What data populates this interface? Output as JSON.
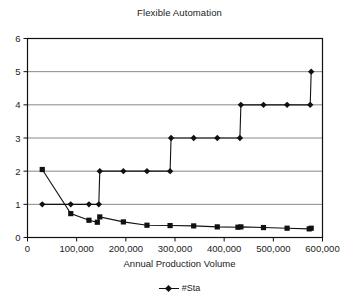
{
  "chart_data": {
    "type": "line",
    "title": "Flexible Automation",
    "xlabel": "Annual Production Volume",
    "ylabel": "",
    "xlim": [
      0,
      600000
    ],
    "ylim": [
      0,
      6
    ],
    "xticks": [
      0,
      100000,
      200000,
      300000,
      400000,
      500000,
      600000
    ],
    "xtick_labels": [
      "0",
      "100,000",
      "200,000",
      "300,000",
      "400,000",
      "500,000",
      "600,000"
    ],
    "yticks": [
      0,
      1,
      2,
      3,
      4,
      5,
      6
    ],
    "ytick_labels": [
      "0",
      "1",
      "2",
      "3",
      "4",
      "5",
      "6"
    ],
    "grid": "horizontal",
    "legend_position": "bottom",
    "series": [
      {
        "name": "#Sta",
        "marker": "diamond",
        "color": "#111111",
        "points": [
          [
            30000,
            1.0
          ],
          [
            88000,
            1.0
          ],
          [
            125000,
            1.0
          ],
          [
            145000,
            1.0
          ],
          [
            147000,
            2.0
          ],
          [
            195000,
            2.0
          ],
          [
            243000,
            2.0
          ],
          [
            290000,
            2.0
          ],
          [
            292000,
            3.0
          ],
          [
            338000,
            3.0
          ],
          [
            386000,
            3.0
          ],
          [
            432000,
            3.0
          ],
          [
            434000,
            4.0
          ],
          [
            480000,
            4.0
          ],
          [
            528000,
            4.0
          ],
          [
            575000,
            4.0
          ],
          [
            577000,
            5.0
          ]
        ]
      },
      {
        "name": "series-2",
        "marker": "square",
        "color": "#111111",
        "points": [
          [
            30000,
            2.05
          ],
          [
            88000,
            0.72
          ],
          [
            125000,
            0.52
          ],
          [
            142000,
            0.46
          ],
          [
            147000,
            0.62
          ],
          [
            195000,
            0.47
          ],
          [
            243000,
            0.37
          ],
          [
            290000,
            0.36
          ],
          [
            338000,
            0.35
          ],
          [
            386000,
            0.32
          ],
          [
            428000,
            0.31
          ],
          [
            434000,
            0.32
          ],
          [
            480000,
            0.3
          ],
          [
            528000,
            0.28
          ],
          [
            573000,
            0.26
          ],
          [
            577000,
            0.28
          ]
        ]
      }
    ],
    "legend_entries": [
      "#Sta"
    ],
    "colors": {
      "axis": "#111111",
      "gridline": "#888888",
      "background": "#ffffff",
      "marker": "#111111"
    }
  }
}
